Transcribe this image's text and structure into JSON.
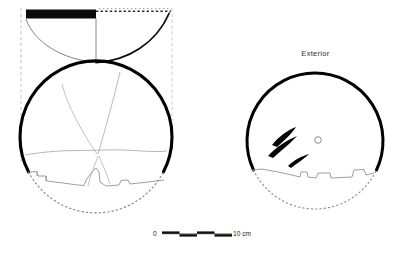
{
  "figure": {
    "type": "archaeological-vessel-drawing",
    "background_color": "#ffffff",
    "ink_color": "#000000",
    "reconstruction_line_color": "#9a9a9a",
    "width": 401,
    "height": 254
  },
  "labels": {
    "exterior": "Exterior"
  },
  "scale_bar": {
    "start_label": "0",
    "end_label": "10 cm",
    "unit": "cm",
    "total_length_cm": 10,
    "segments": 4,
    "segment_length_cm": 2.5,
    "x_start_px": 162,
    "x_end_px": 232,
    "y_px": 234
  },
  "views": {
    "section": {
      "name": "cross-section-profile",
      "rim_fill": "solid-black-left-half",
      "rim_y_px": 14,
      "rim_black_from_px": 27,
      "rim_black_to_px": 96,
      "rim_dotted_from_px": 96,
      "rim_dotted_to_px": 172,
      "bounding_dashed_left_px": 21,
      "bounding_dashed_right_px": 172,
      "bowl_depth_px": 50
    },
    "plan_interior": {
      "name": "interior-plan-view",
      "center_x_px": 96,
      "center_y_px": 142,
      "radius_px": 76,
      "preserved": "upper-portion",
      "break_edge": "stepped-irregular",
      "reconstruction": "dotted-arc-lower",
      "crack_lines": 4
    },
    "plan_exterior": {
      "name": "exterior-plan-view",
      "center_x_px": 315,
      "center_y_px": 134,
      "radius_px": 68,
      "preserved": "upper-portion",
      "break_edge": "stepped-irregular",
      "reconstruction": "dotted-arc-lower",
      "decoration_marks": 3,
      "perforation_marks": 1
    }
  }
}
